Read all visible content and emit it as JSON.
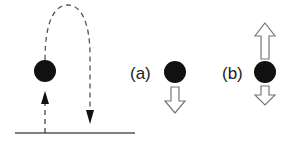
{
  "diagram": {
    "trajectory": {
      "ground": "horizontal line",
      "path": "dashed upward then arcing downward",
      "ball_color": "#111111"
    },
    "panels": [
      {
        "label": "(a)",
        "arrows": [
          {
            "direction": "down",
            "style": "hollow",
            "length": "medium"
          }
        ]
      },
      {
        "label": "(b)",
        "arrows": [
          {
            "direction": "up",
            "style": "hollow",
            "length": "long"
          },
          {
            "direction": "down",
            "style": "hollow",
            "length": "short"
          }
        ]
      }
    ],
    "colors": {
      "ink": "#222222",
      "dash": "#444444",
      "ground": "#555555",
      "hollow_fill": "#ffffff",
      "hollow_stroke": "#777777"
    }
  }
}
